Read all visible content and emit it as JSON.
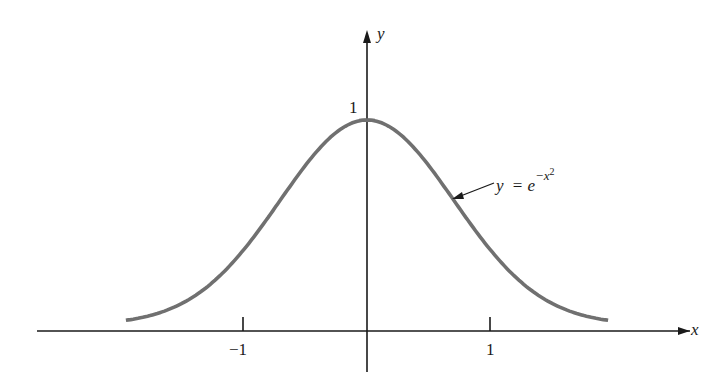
{
  "chart_data": {
    "type": "line",
    "title": "",
    "xlabel": "x",
    "ylabel": "y",
    "x_ticks": [
      {
        "value": -1,
        "label": "−1"
      },
      {
        "value": 1,
        "label": "1"
      }
    ],
    "y_ticks": [
      {
        "value": 1,
        "label": "1"
      }
    ],
    "xlim": [
      -2.7,
      2.7
    ],
    "ylim": [
      -0.2,
      1.3
    ],
    "grid": false,
    "series": [
      {
        "name": "y = e^{-x^2}",
        "function": "exp(-x^2)",
        "x": [
          -1.95,
          -1.5,
          -1.0,
          -0.5,
          0,
          0.5,
          1.0,
          1.5,
          1.95
        ],
        "values": [
          0.022,
          0.105,
          0.368,
          0.779,
          1.0,
          0.779,
          0.368,
          0.105,
          0.022
        ],
        "color": "#707070"
      }
    ],
    "annotations": [
      {
        "text": "y = e",
        "superscript": "−x",
        "superscript2": "2",
        "points_to_x": 0.7
      }
    ]
  },
  "labels": {
    "y_axis": "y",
    "x_axis": "x",
    "y_tick_1": "1",
    "x_tick_neg1": "−1",
    "x_tick_1": "1",
    "eq_y": "y",
    "eq_eq": "=",
    "eq_e": "e",
    "eq_exp": "−x",
    "eq_sq": "2"
  }
}
